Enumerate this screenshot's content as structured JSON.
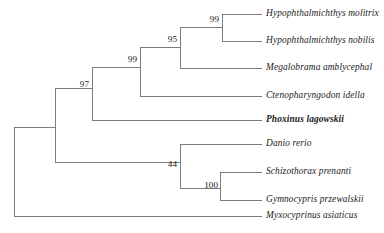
{
  "figure": {
    "type": "phylogenetic-tree",
    "style": "rectangular-cladogram",
    "line_color": "#6e6e6e",
    "text_color": "#1a1a1a",
    "background": "#ffffff",
    "width": 384,
    "height": 233
  },
  "taxa": [
    {
      "id": "hypophthalmichthys-molitrix",
      "label": "Hypophthalmichthys molitrix",
      "bold": false,
      "tip_x": 262,
      "tip_y": 14,
      "branch_x": 222
    },
    {
      "id": "hypophthalmichthys-nobilis",
      "label": "Hypophthalmichthys nobilis",
      "bold": false,
      "tip_x": 262,
      "tip_y": 41,
      "branch_x": 222
    },
    {
      "id": "megalobrama-amblycephal",
      "label": "Megalobrama amblycephal",
      "bold": false,
      "tip_x": 262,
      "tip_y": 68,
      "branch_x": 180
    },
    {
      "id": "ctenopharyngodon-idella",
      "label": "Ctenopharyngodon idella",
      "bold": false,
      "tip_x": 262,
      "tip_y": 96,
      "branch_x": 140
    },
    {
      "id": "phoxinus-lagowskii",
      "label": "Phoxinus lagowskii",
      "bold": true,
      "tip_x": 262,
      "tip_y": 120,
      "branch_x": 92
    },
    {
      "id": "danio-rerio",
      "label": "Danio rerio",
      "bold": false,
      "tip_x": 262,
      "tip_y": 144,
      "branch_x": 180
    },
    {
      "id": "schizothorax-prenanti",
      "label": "Schizothorax prenanti",
      "bold": false,
      "tip_x": 262,
      "tip_y": 172,
      "branch_x": 220
    },
    {
      "id": "gymnocypris-przewalskii",
      "label": "Gymnocypris przewalskii",
      "bold": false,
      "tip_x": 262,
      "tip_y": 200,
      "branch_x": 220
    },
    {
      "id": "myxocyprinus-asiaticus",
      "label": "Myxocyprinus asiaticus",
      "bold": false,
      "tip_x": 262,
      "tip_y": 216,
      "branch_x": 14
    }
  ],
  "nodes": [
    {
      "id": "node-molitrix-nobilis",
      "support": "99",
      "x": 222,
      "y_top": 14,
      "y_bottom": 41,
      "stem_y": 27,
      "stem_x": 180,
      "label_x": 219,
      "label_y": 20
    },
    {
      "id": "node-hypophthalmichthys-megalobrama",
      "support": "95",
      "x": 180,
      "y_top": 27,
      "y_bottom": 68,
      "stem_y": 47,
      "stem_x": 140,
      "label_x": 177,
      "label_y": 40
    },
    {
      "id": "node-ctenopharyngodon-clade",
      "support": "99",
      "x": 140,
      "y_top": 47,
      "y_bottom": 96,
      "stem_y": 67,
      "stem_x": 92,
      "label_x": 137,
      "label_y": 60
    },
    {
      "id": "node-phoxinus-clade",
      "support": "97",
      "x": 92,
      "y_top": 67,
      "y_bottom": 120,
      "stem_y": 88,
      "stem_x": 55,
      "label_x": 89,
      "label_y": 85
    },
    {
      "id": "node-danio-clade",
      "support": "44",
      "x": 180,
      "y_top": 144,
      "y_bottom": 188,
      "stem_y": 162,
      "stem_x": 55,
      "label_x": 177,
      "label_y": 165
    },
    {
      "id": "node-schizothorax-gymnocypris",
      "support": "100",
      "x": 220,
      "y_top": 172,
      "y_bottom": 200,
      "stem_y": 188,
      "stem_x": 180,
      "label_x": 218,
      "label_y": 186
    },
    {
      "id": "node-cyprinid-crown",
      "support": "",
      "x": 55,
      "y_top": 88,
      "y_bottom": 162,
      "stem_y": 127,
      "stem_x": 14,
      "label_x": 0,
      "label_y": 0
    },
    {
      "id": "node-root",
      "support": "",
      "x": 14,
      "y_top": 127,
      "y_bottom": 216,
      "stem_y": 0,
      "stem_x": 0,
      "label_x": 0,
      "label_y": 0
    }
  ],
  "chart_data": {
    "type": "tree",
    "title": "",
    "tip_labels": [
      "Hypophthalmichthys molitrix",
      "Hypophthalmichthys nobilis",
      "Megalobrama amblycephal",
      "Ctenopharyngodon idella",
      "Phoxinus lagowskii",
      "Danio rerio",
      "Schizothorax prenanti",
      "Gymnocypris przewalskii",
      "Myxocyprinus asiaticus"
    ],
    "support_values": [
      "99",
      "95",
      "99",
      "97",
      "44",
      "100"
    ],
    "newick": "((((((Hypophthalmichthys_molitrix,Hypophthalmichthys_nobilis)99,Megalobrama_amblycephal)95,Ctenopharyngodon_idella)99,Phoxinus_lagowskii)97,(Danio_rerio,(Schizothorax_prenanti,Gymnocypris_przewalskii)100)44),Myxocyprinus_asiaticus);",
    "outgroup": "Myxocyprinus asiaticus",
    "highlighted_taxon": "Phoxinus lagowskii",
    "legend": "",
    "grid": false,
    "axis": "none"
  }
}
